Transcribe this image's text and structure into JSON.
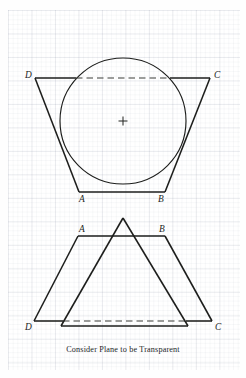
{
  "figure": {
    "caption": "Consider Plane to be Transparent",
    "background_color": "#fefefe",
    "ink_color": "#1d1e1c",
    "grid_color": "#c9cfd9",
    "labels": {
      "upper_D": "D",
      "upper_C": "C",
      "upper_A": "A",
      "upper_B": "B",
      "lower_A": "A",
      "lower_B": "B",
      "lower_D": "D",
      "lower_C": "C"
    },
    "upper_view": {
      "name": "plan-view-with-inscribed-circle",
      "trapezoid": {
        "D": [
          35,
          78
        ],
        "C": [
          210,
          78
        ],
        "B": [
          165,
          192
        ],
        "A": [
          79,
          192
        ]
      },
      "circle": {
        "center_x": 123,
        "center_y": 121,
        "radius": 63
      },
      "center_mark": "+",
      "hidden_edge": "D-C segment inside circle drawn dashed"
    },
    "lower_view": {
      "name": "elevation-view-trapezoid-and-triangle",
      "trapezoid": {
        "A": [
          78,
          236
        ],
        "B": [
          165,
          236
        ],
        "C": [
          212,
          321
        ],
        "D": [
          34,
          321
        ]
      },
      "triangle": {
        "apex": [
          123,
          218
        ],
        "base_left": [
          61,
          326
        ],
        "base_right": [
          188,
          326
        ]
      },
      "hidden_edge": "D-C segment behind triangle drawn dashed"
    }
  }
}
